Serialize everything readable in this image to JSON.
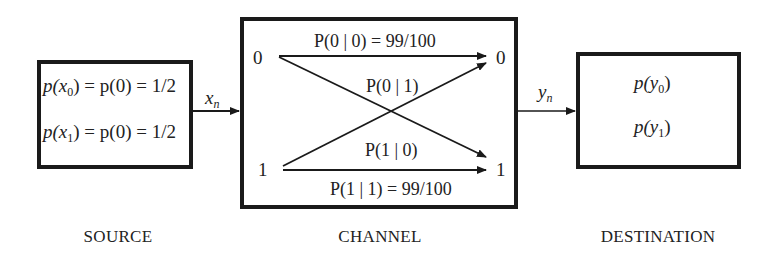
{
  "source": {
    "caption": "SOURCE",
    "line1": {
      "lhs": "p(x",
      "sub": "0",
      "rhs": ") = p(0) = 1/2"
    },
    "line2": {
      "lhs": "p(x",
      "sub": "1",
      "rhs": ") = p(0) = 1/2"
    },
    "output_label": {
      "var": "x",
      "sub": "n"
    }
  },
  "channel": {
    "caption": "CHANNEL",
    "input_symbols": [
      "0",
      "1"
    ],
    "output_symbols": [
      "0",
      "1"
    ],
    "p00": "P(0 | 0) = 99/100",
    "p01": "P(0 | 1)",
    "p10": "P(1 | 0)",
    "p11": "P(1 | 1) = 99/100",
    "output_label": {
      "var": "y",
      "sub": "n"
    }
  },
  "destination": {
    "caption": "DESTINATION",
    "line1": {
      "lhs": "p(y",
      "sub": "0",
      "rhs": ")"
    },
    "line2": {
      "lhs": "p(y",
      "sub": "1",
      "rhs": ")"
    }
  },
  "colors": {
    "stroke": "#1a1a1a",
    "background": "#ffffff"
  }
}
